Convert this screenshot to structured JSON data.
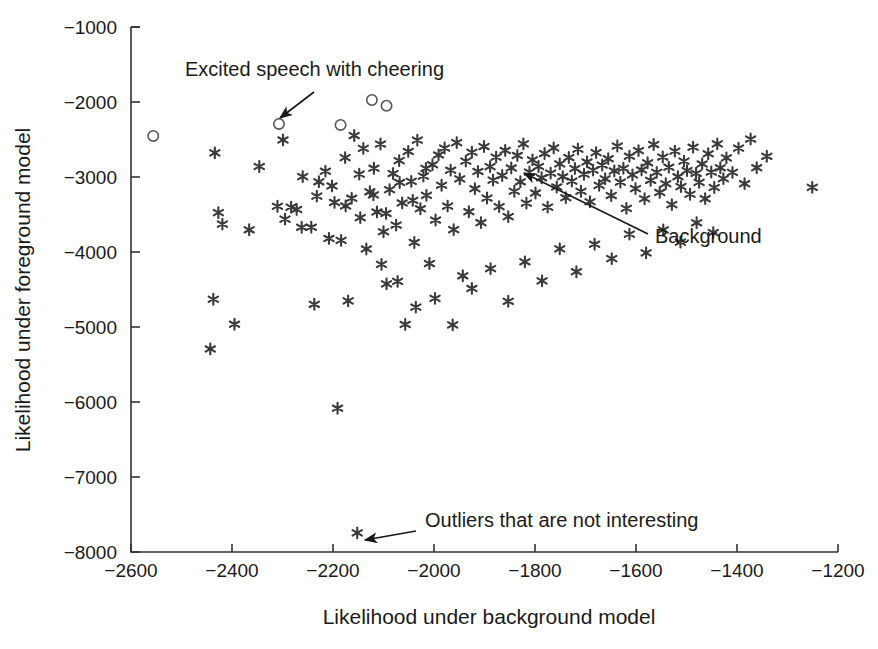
{
  "figure": {
    "width": 878,
    "height": 649,
    "background": "#ffffff",
    "ink_color": "#1a1a1a",
    "marker_color": "#3a3a3a"
  },
  "chart_data": {
    "type": "scatter",
    "title": "",
    "xlabel": "Likelihood under background model",
    "ylabel": "Likelihood under foreground model",
    "xlim": [
      -2600,
      -1200
    ],
    "ylim": [
      -8000,
      -1000
    ],
    "xticks": [
      -2600,
      -2400,
      -2200,
      -2000,
      -1800,
      -1600,
      -1400,
      -1200
    ],
    "xticklabels": [
      "−2600",
      "−2400",
      "−2200",
      "−2000",
      "−1800",
      "−1600",
      "−1400",
      "−1200"
    ],
    "yticks": [
      -8000,
      -7000,
      -6000,
      -5000,
      -4000,
      -3000,
      -2000,
      -1000
    ],
    "yticklabels": [
      "−8000",
      "−7000",
      "−6000",
      "−5000",
      "−4000",
      "−3000",
      "−2000",
      "−1000"
    ],
    "grid": false,
    "legend": null,
    "series": [
      {
        "name": "Background",
        "marker": "asterisk",
        "color": "#3a3a3a",
        "points": [
          [
            -2434,
            -2678
          ],
          [
            -2427,
            -3475
          ],
          [
            -2419,
            -3628
          ],
          [
            -2437,
            -4630
          ],
          [
            -2443,
            -5293
          ],
          [
            -2395,
            -4963
          ],
          [
            -2366,
            -3704
          ],
          [
            -2346,
            -2860
          ],
          [
            -2310,
            -3390
          ],
          [
            -2299,
            -2506
          ],
          [
            -2295,
            -3562
          ],
          [
            -2283,
            -3402
          ],
          [
            -2272,
            -3433
          ],
          [
            -2262,
            -3671
          ],
          [
            -2243,
            -3669
          ],
          [
            -2237,
            -4697
          ],
          [
            -2228,
            -3064
          ],
          [
            -2215,
            -2923
          ],
          [
            -2208,
            -3819
          ],
          [
            -2197,
            -3339
          ],
          [
            -2191,
            -6083
          ],
          [
            -2184,
            -3845
          ],
          [
            -2176,
            -2742
          ],
          [
            -2170,
            -4652
          ],
          [
            -2163,
            -3283
          ],
          [
            -2158,
            -2447
          ],
          [
            -2152,
            -7745
          ],
          [
            -2146,
            -3542
          ],
          [
            -2140,
            -2618
          ],
          [
            -2134,
            -3959
          ],
          [
            -2127,
            -3197
          ],
          [
            -2119,
            -2883
          ],
          [
            -2113,
            -3466
          ],
          [
            -2106,
            -2561
          ],
          [
            -2100,
            -3730
          ],
          [
            -2094,
            -4425
          ],
          [
            -2088,
            -3168
          ],
          [
            -2081,
            -2954
          ],
          [
            -2075,
            -3641
          ],
          [
            -2069,
            -2782
          ],
          [
            -2063,
            -3346
          ],
          [
            -2057,
            -4966
          ],
          [
            -2051,
            -2659
          ],
          [
            -2045,
            -3058
          ],
          [
            -2039,
            -3873
          ],
          [
            -2033,
            -2508
          ],
          [
            -2027,
            -3423
          ],
          [
            -2021,
            -2988
          ],
          [
            -2015,
            -3245
          ],
          [
            -2009,
            -4154
          ],
          [
            -2003,
            -2836
          ],
          [
            -1997,
            -3574
          ],
          [
            -1991,
            -2706
          ],
          [
            -1985,
            -3110
          ],
          [
            -1979,
            -2614
          ],
          [
            -1973,
            -3388
          ],
          [
            -1967,
            -2909
          ],
          [
            -1961,
            -3702
          ],
          [
            -1955,
            -2542
          ],
          [
            -1949,
            -3025
          ],
          [
            -1943,
            -4317
          ],
          [
            -1937,
            -2788
          ],
          [
            -1931,
            -3463
          ],
          [
            -1925,
            -2670
          ],
          [
            -1919,
            -3156
          ],
          [
            -1913,
            -2926
          ],
          [
            -1907,
            -3609
          ],
          [
            -1901,
            -2594
          ],
          [
            -1895,
            -3281
          ],
          [
            -1889,
            -2862
          ],
          [
            -1883,
            -3042
          ],
          [
            -1877,
            -2735
          ],
          [
            -1871,
            -3395
          ],
          [
            -1865,
            -2981
          ],
          [
            -1859,
            -2646
          ],
          [
            -1853,
            -3528
          ],
          [
            -1847,
            -2879
          ],
          [
            -1841,
            -3190
          ],
          [
            -1835,
            -2713
          ],
          [
            -1829,
            -3064
          ],
          [
            -1823,
            -2558
          ],
          [
            -1817,
            -3348
          ],
          [
            -1811,
            -2934
          ],
          [
            -1805,
            -2772
          ],
          [
            -1799,
            -3213
          ],
          [
            -1793,
            -2860
          ],
          [
            -1787,
            -3011
          ],
          [
            -1781,
            -2687
          ],
          [
            -1775,
            -3402
          ],
          [
            -1769,
            -2948
          ],
          [
            -1763,
            -2612
          ],
          [
            -1757,
            -3133
          ],
          [
            -1751,
            -2825
          ],
          [
            -1745,
            -2996
          ],
          [
            -1739,
            -3276
          ],
          [
            -1733,
            -2741
          ],
          [
            -1727,
            -3055
          ],
          [
            -1721,
            -2887
          ],
          [
            -1715,
            -2628
          ],
          [
            -1709,
            -3190
          ],
          [
            -1703,
            -2963
          ],
          [
            -1697,
            -2799
          ],
          [
            -1691,
            -3330
          ],
          [
            -1685,
            -2908
          ],
          [
            -1679,
            -2675
          ],
          [
            -1673,
            -3112
          ],
          [
            -1667,
            -2841
          ],
          [
            -1661,
            -3024
          ],
          [
            -1655,
            -2756
          ],
          [
            -1649,
            -3247
          ],
          [
            -1643,
            -2919
          ],
          [
            -1637,
            -2587
          ],
          [
            -1631,
            -3068
          ],
          [
            -1625,
            -2884
          ],
          [
            -1619,
            -3418
          ],
          [
            -1613,
            -2723
          ],
          [
            -1607,
            -2972
          ],
          [
            -1601,
            -3155
          ],
          [
            -1595,
            -2648
          ],
          [
            -1589,
            -2906
          ],
          [
            -1583,
            -3290
          ],
          [
            -1577,
            -2811
          ],
          [
            -1571,
            -3044
          ],
          [
            -1565,
            -2567
          ],
          [
            -1559,
            -2938
          ],
          [
            -1553,
            -3206
          ],
          [
            -1547,
            -2734
          ],
          [
            -1541,
            -3090
          ],
          [
            -1535,
            -2869
          ],
          [
            -1529,
            -3368
          ],
          [
            -1523,
            -2655
          ],
          [
            -1517,
            -2996
          ],
          [
            -1511,
            -3128
          ],
          [
            -1505,
            -2788
          ],
          [
            -1499,
            -2915
          ],
          [
            -1493,
            -3230
          ],
          [
            -1487,
            -2603
          ],
          [
            -1481,
            -2951
          ],
          [
            -1475,
            -3072
          ],
          [
            -1469,
            -2826
          ],
          [
            -1463,
            -3289
          ],
          [
            -1457,
            -2690
          ],
          [
            -1451,
            -2934
          ],
          [
            -1445,
            -3140
          ],
          [
            -1439,
            -2558
          ],
          [
            -1433,
            -2877
          ],
          [
            -1427,
            -3022
          ],
          [
            -1421,
            -2745
          ],
          [
            -1409,
            -2938
          ],
          [
            -1397,
            -2615
          ],
          [
            -1385,
            -3089
          ],
          [
            -1373,
            -2494
          ],
          [
            -1361,
            -2876
          ],
          [
            -1341,
            -2724
          ],
          [
            -1251,
            -3138
          ],
          [
            -2104,
            -4165
          ],
          [
            -2072,
            -4392
          ],
          [
            -2036,
            -4735
          ],
          [
            -1998,
            -4618
          ],
          [
            -1963,
            -4972
          ],
          [
            -1925,
            -4486
          ],
          [
            -1888,
            -4222
          ],
          [
            -1853,
            -4657
          ],
          [
            -1820,
            -4131
          ],
          [
            -1786,
            -4385
          ],
          [
            -1751,
            -3958
          ],
          [
            -1718,
            -4263
          ],
          [
            -1682,
            -3896
          ],
          [
            -1648,
            -4088
          ],
          [
            -1613,
            -3762
          ],
          [
            -1580,
            -4012
          ],
          [
            -1546,
            -3705
          ],
          [
            -1512,
            -3868
          ],
          [
            -1480,
            -3611
          ],
          [
            -1447,
            -3742
          ],
          [
            -2260,
            -2995
          ],
          [
            -2232,
            -3255
          ],
          [
            -2202,
            -3119
          ],
          [
            -2175,
            -3386
          ],
          [
            -2148,
            -2962
          ],
          [
            -2120,
            -3238
          ],
          [
            -2095,
            -3486
          ],
          [
            -2068,
            -3073
          ],
          [
            -2042,
            -3312
          ],
          [
            -2016,
            -2885
          ]
        ]
      },
      {
        "name": "Excited speech with cheering",
        "marker": "open-circle",
        "color": "#555555",
        "points": [
          [
            -2556,
            -2452
          ],
          [
            -2307,
            -2292
          ],
          [
            -2185,
            -2306
          ],
          [
            -2123,
            -1973
          ],
          [
            -2094,
            -2050
          ]
        ]
      }
    ],
    "annotations": [
      {
        "name": "excited-speech-annotation",
        "text": "Excited speech with cheering",
        "text_x": 185,
        "text_y": 76,
        "anchor": "start",
        "arrow": {
          "from_x": 314,
          "from_y": 92,
          "to_x": 280,
          "to_y": 118,
          "head": true
        }
      },
      {
        "name": "background-annotation",
        "text": "Background",
        "text_x": 655,
        "text_y": 243,
        "anchor": "start",
        "arrow": {
          "from_x": 648,
          "from_y": 234,
          "to_x": 524,
          "to_y": 173,
          "head": true
        }
      },
      {
        "name": "outliers-annotation",
        "text": "Outliers that are not interesting",
        "text_x": 425,
        "text_y": 527,
        "anchor": "start",
        "arrow": {
          "from_x": 416,
          "from_y": 531,
          "to_x": 365,
          "to_y": 540,
          "head": true
        }
      }
    ]
  }
}
